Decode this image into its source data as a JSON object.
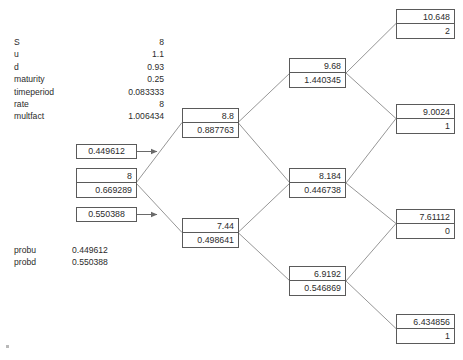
{
  "parameters": {
    "rows": [
      {
        "name": "S",
        "value": "8"
      },
      {
        "name": "u",
        "value": "1.1"
      },
      {
        "name": "d",
        "value": "0.93"
      },
      {
        "name": "maturity",
        "value": "0.25"
      },
      {
        "name": "timeperiod",
        "value": "0.083333"
      },
      {
        "name": "rate",
        "value": "8"
      },
      {
        "name": "multfact",
        "value": "1.006434"
      }
    ]
  },
  "legend": {
    "rows": [
      {
        "name": "probu",
        "value": "0.449612"
      },
      {
        "name": "probd",
        "value": "0.550388"
      }
    ]
  },
  "annotations": {
    "prob_up": "0.449612",
    "prob_down": "0.550388"
  },
  "tree": {
    "root": {
      "price": "8",
      "value": "0.669289"
    },
    "level1": [
      {
        "price": "8.8",
        "value": "0.887763"
      },
      {
        "price": "7.44",
        "value": "0.498641"
      }
    ],
    "level2": [
      {
        "price": "9.68",
        "value": "1.440345"
      },
      {
        "price": "8.184",
        "value": "0.446738"
      },
      {
        "price": "6.9192",
        "value": "0.546869"
      }
    ],
    "level3": [
      {
        "price": "10.648",
        "value": "2"
      },
      {
        "price": "9.0024",
        "value": "1"
      },
      {
        "price": "7.61112",
        "value": "0"
      },
      {
        "price": "6.434856",
        "value": "1"
      }
    ]
  },
  "colors": {
    "border": "#5a5a5a",
    "text": "#2b2b2b",
    "background": "#ffffff"
  }
}
